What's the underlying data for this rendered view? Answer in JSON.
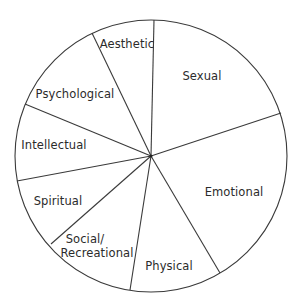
{
  "diagram": {
    "type": "segmented-circle",
    "center": [
      151,
      156
    ],
    "radius": 136,
    "line_color": "#3a3a3a",
    "text_color": "#2b2b2b",
    "dividers": [
      {
        "name": "aesthetic-sexual",
        "end": [
          154,
          20
        ]
      },
      {
        "name": "sexual-emotional",
        "end": [
          281,
          113
        ]
      },
      {
        "name": "emotional-physical",
        "end": [
          220,
          273
        ]
      },
      {
        "name": "physical-social",
        "end": [
          130,
          290
        ]
      },
      {
        "name": "social-spiritual",
        "end": [
          51,
          244
        ]
      },
      {
        "name": "spiritual-intellectual",
        "end": [
          17,
          181
        ]
      },
      {
        "name": "intellectual-psychological",
        "end": [
          25,
          104
        ]
      },
      {
        "name": "psychological-aesthetic",
        "end": [
          92,
          33
        ]
      }
    ],
    "segments": [
      {
        "label": "Aesthetic",
        "x": 127,
        "y": 48
      },
      {
        "label": "Sexual",
        "x": 202,
        "y": 80
      },
      {
        "label": "Emotional",
        "x": 234,
        "y": 196
      },
      {
        "label": "Physical",
        "x": 169,
        "y": 270
      },
      {
        "label": "Social/",
        "label2": "Recreational",
        "x": 97,
        "y": 243,
        "y2": 257
      },
      {
        "label": "Spiritual",
        "x": 58,
        "y": 205
      },
      {
        "label": "Intellectual",
        "x": 54,
        "y": 149
      },
      {
        "label": "Psychological",
        "x": 75,
        "y": 98
      }
    ]
  }
}
